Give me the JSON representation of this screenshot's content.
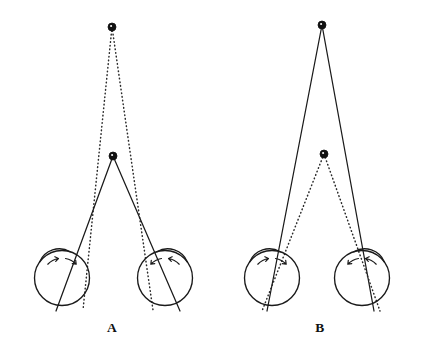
{
  "figure": {
    "background_color": "#ffffff",
    "line_color": "#1a1a1a",
    "dot_color": "#111111",
    "width": 422,
    "height": 350
  },
  "panels": [
    {
      "id": "A",
      "label": "A",
      "label_x": 112,
      "label_y": 332,
      "far_point": {
        "name": "far-fixation-dot",
        "x": 112,
        "y": 27,
        "radius": 4.0,
        "ray_style": "dotted"
      },
      "near_point": {
        "name": "near-fixation-dot",
        "x": 113,
        "y": 156,
        "radius": 4.0,
        "ray_style": "solid"
      },
      "eyes": [
        {
          "side": "left",
          "center_x": 62,
          "center_y": 278,
          "radius": 27.5,
          "cornea_top_x": 76,
          "cornea_top_y": 250,
          "axis_top_x": 80,
          "axis_top_y": 252,
          "axis_bottom_x": 46,
          "axis_bottom_y": 307
        },
        {
          "side": "right",
          "center_x": 165,
          "center_y": 278,
          "radius": 27.5,
          "cornea_top_x": 151,
          "cornea_top_y": 250,
          "axis_top_x": 147,
          "axis_top_y": 252,
          "axis_bottom_x": 181,
          "axis_bottom_y": 307
        }
      ]
    },
    {
      "id": "B",
      "label": "B",
      "label_x": 320,
      "label_y": 332,
      "far_point": {
        "name": "far-fixation-dot",
        "x": 322,
        "y": 25,
        "radius": 4.0,
        "ray_style": "solid"
      },
      "near_point": {
        "name": "near-fixation-dot",
        "x": 324,
        "y": 154,
        "radius": 4.0,
        "ray_style": "dotted"
      },
      "eyes": [
        {
          "side": "left",
          "center_x": 272,
          "center_y": 278,
          "radius": 27.5,
          "cornea_top_x": 284,
          "cornea_top_y": 250,
          "axis_top_x": 288,
          "axis_top_y": 251,
          "axis_bottom_x": 258,
          "axis_bottom_y": 307
        },
        {
          "side": "right",
          "center_x": 362,
          "center_y": 278,
          "radius": 27.5,
          "cornea_top_x": 374,
          "cornea_top_y": 250,
          "axis_top_x": 378,
          "axis_top_y": 251,
          "axis_bottom_x": 348,
          "axis_bottom_y": 307
        }
      ]
    }
  ],
  "rays": {
    "panel_a_dotted": [
      {
        "name": "far-to-left-eye",
        "x1": 112,
        "y1": 27,
        "x2": 83,
        "y2": 310
      },
      {
        "name": "far-to-right-eye",
        "x1": 112,
        "y1": 27,
        "x2": 153,
        "y2": 310
      }
    ],
    "panel_a_solid": [
      {
        "name": "near-to-left-eye",
        "x1": 113,
        "y1": 156,
        "x2": 56,
        "y2": 311
      },
      {
        "name": "near-to-right-eye",
        "x1": 113,
        "y1": 156,
        "x2": 180,
        "y2": 311
      }
    ],
    "panel_b_solid": [
      {
        "name": "far-to-left-eye",
        "x1": 322,
        "y1": 25,
        "x2": 267,
        "y2": 311
      },
      {
        "name": "far-to-right-eye",
        "x1": 322,
        "y1": 25,
        "x2": 374,
        "y2": 311
      }
    ],
    "panel_b_dotted": [
      {
        "name": "near-to-left-eye",
        "x1": 324,
        "y1": 154,
        "x2": 262,
        "y2": 311
      },
      {
        "name": "near-to-right-eye",
        "x1": 324,
        "y1": 154,
        "x2": 380,
        "y2": 311
      }
    ]
  }
}
